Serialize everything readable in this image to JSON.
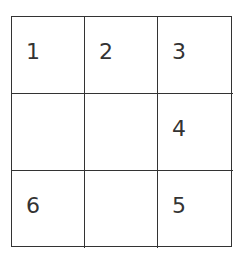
{
  "grid": {
    "rows": 3,
    "cols": 3,
    "cells": [
      {
        "label": "1"
      },
      {
        "label": "2"
      },
      {
        "label": "3"
      },
      {
        "label": ""
      },
      {
        "label": ""
      },
      {
        "label": "4"
      },
      {
        "label": "6"
      },
      {
        "label": ""
      },
      {
        "label": "5"
      }
    ]
  }
}
